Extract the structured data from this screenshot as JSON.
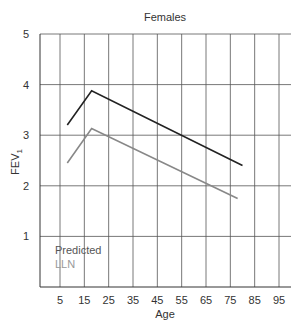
{
  "chart_data": {
    "type": "line",
    "title": "Females",
    "xlabel": "Age",
    "ylabel": "FEV",
    "ylabel_subscript": "1",
    "xlim": [
      0,
      100
    ],
    "ylim": [
      0,
      5
    ],
    "x_ticks": [
      5,
      15,
      25,
      35,
      45,
      55,
      65,
      75,
      85,
      95
    ],
    "y_ticks": [
      1,
      2,
      3,
      4,
      5
    ],
    "grid": true,
    "legend_position": "lower-left inside",
    "series": [
      {
        "name": "Predicted",
        "color": "#222222",
        "x": [
          8,
          18,
          80
        ],
        "y": [
          3.2,
          3.88,
          2.4
        ]
      },
      {
        "name": "LLN",
        "color": "#888888",
        "x": [
          8,
          18,
          78
        ],
        "y": [
          2.45,
          3.13,
          1.75
        ]
      }
    ]
  },
  "legend": {
    "predicted": "Predicted",
    "lln": "LLN"
  }
}
